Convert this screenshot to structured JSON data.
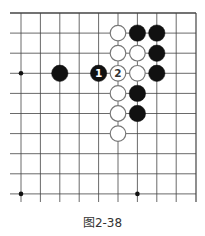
{
  "figure": {
    "caption": "图2-38",
    "board": {
      "grid_origin_x": 21,
      "grid_origin_y": 13,
      "spacing_x": 19.4,
      "spacing_y": 20.1,
      "columns": 10,
      "rows": 10,
      "left_edge_x": 10,
      "right_edge_x": 196,
      "top_edge_y": 13,
      "bottom_extend_y": 202,
      "line_color": "#444444",
      "star_points": [
        {
          "col": 0,
          "row": 3
        },
        {
          "col": 0,
          "row": 9
        },
        {
          "col": 6,
          "row": 9
        }
      ],
      "stones": [
        {
          "color": "white",
          "col": 5,
          "row": 1
        },
        {
          "color": "black",
          "col": 6,
          "row": 1
        },
        {
          "color": "black",
          "col": 7,
          "row": 1
        },
        {
          "color": "white",
          "col": 5,
          "row": 2
        },
        {
          "color": "white",
          "col": 6,
          "row": 2
        },
        {
          "color": "black",
          "col": 7,
          "row": 2
        },
        {
          "color": "black",
          "col": 2,
          "row": 3
        },
        {
          "color": "black",
          "col": 4,
          "row": 3,
          "label": "1"
        },
        {
          "color": "white",
          "col": 5,
          "row": 3,
          "label": "2"
        },
        {
          "color": "white",
          "col": 6,
          "row": 3
        },
        {
          "color": "black",
          "col": 7,
          "row": 3
        },
        {
          "color": "white",
          "col": 5,
          "row": 4
        },
        {
          "color": "black",
          "col": 6,
          "row": 4
        },
        {
          "color": "white",
          "col": 5,
          "row": 5
        },
        {
          "color": "black",
          "col": 6,
          "row": 5
        },
        {
          "color": "white",
          "col": 5,
          "row": 6
        }
      ]
    }
  }
}
